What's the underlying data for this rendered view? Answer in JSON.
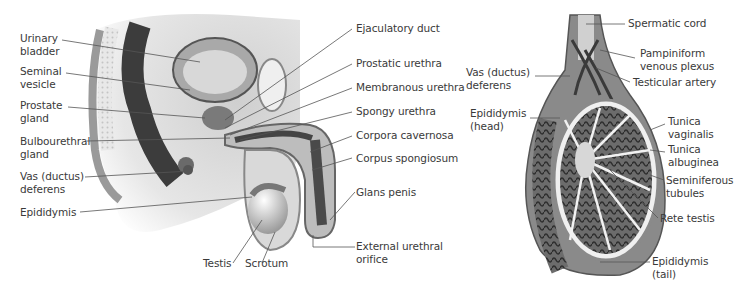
{
  "left_figure": {
    "name": "Male reproductive system sagittal section",
    "labels_left": [
      {
        "id": "urinary-bladder",
        "text": "Urinary\nbladder"
      },
      {
        "id": "seminal-vesicle",
        "text": "Seminal\nvesicle"
      },
      {
        "id": "prostate-gland",
        "text": "Prostate\ngland"
      },
      {
        "id": "bulbourethral-gland",
        "text": "Bulbourethral\ngland"
      },
      {
        "id": "vas-deferens",
        "text": "Vas (ductus)\ndeferens"
      },
      {
        "id": "epididymis",
        "text": "Epididymis"
      }
    ],
    "labels_right": [
      {
        "id": "ejaculatory-duct",
        "text": "Ejaculatory duct"
      },
      {
        "id": "prostatic-urethra",
        "text": "Prostatic urethra"
      },
      {
        "id": "membranous-urethra",
        "text": "Membranous urethra"
      },
      {
        "id": "spongy-urethra",
        "text": "Spongy urethra"
      },
      {
        "id": "corpora-cavernosa",
        "text": "Corpora cavernosa"
      },
      {
        "id": "corpus-spongiosum",
        "text": "Corpus spongiosum"
      },
      {
        "id": "glans-penis",
        "text": "Glans penis"
      },
      {
        "id": "external-urethral-orifice",
        "text": "External urethral\norifice"
      }
    ],
    "labels_bottom": [
      {
        "id": "testis",
        "text": "Testis"
      },
      {
        "id": "scrotum",
        "text": "Scrotum"
      }
    ]
  },
  "right_figure": {
    "name": "Testis and spermatic cord cross-section",
    "labels_left": [
      {
        "id": "vas-deferens-r",
        "text": "Vas (ductus)\ndeferens"
      },
      {
        "id": "epididymis-head",
        "text": "Epididymis\n(head)"
      }
    ],
    "labels_right": [
      {
        "id": "spermatic-cord",
        "text": "Spermatic cord"
      },
      {
        "id": "pampiniform-plexus",
        "text": "Pampiniform\nvenous plexus"
      },
      {
        "id": "testicular-artery",
        "text": "Testicular artery"
      },
      {
        "id": "tunica-vaginalis",
        "text": "Tunica\nvaginalis"
      },
      {
        "id": "tunica-albuginea",
        "text": "Tunica\nalbuginea"
      },
      {
        "id": "seminiferous-tubules",
        "text": "Seminiferous\ntubules"
      },
      {
        "id": "rete-testis",
        "text": "Rete testis"
      },
      {
        "id": "epididymis-tail",
        "text": "Epididymis\n(tail)"
      }
    ]
  },
  "colors": {
    "text": "#3a3a3a",
    "line": "#555555",
    "tissue_dark": "#4a4a4a",
    "tissue_mid": "#8a8a8a",
    "tissue_light": "#d4d4d4"
  }
}
